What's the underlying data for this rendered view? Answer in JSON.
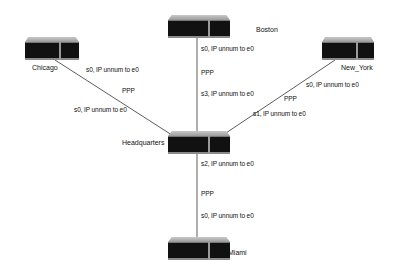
{
  "diagram": {
    "type": "network-topology",
    "nodes": [
      {
        "id": "chicago",
        "label": "Chicago"
      },
      {
        "id": "boston",
        "label": "Boston"
      },
      {
        "id": "new_york",
        "label": "New_York"
      },
      {
        "id": "headquarters",
        "label": "Headquarters"
      },
      {
        "id": "miami",
        "label": "Miami"
      }
    ],
    "links": [
      {
        "from": "chicago",
        "to": "headquarters",
        "protocol": "PPP",
        "near_label": "s0, IP unnum to e0",
        "far_label": "s0, IP unnum to e0"
      },
      {
        "from": "boston",
        "to": "headquarters",
        "protocol": "PPP",
        "near_label": "s0, IP unnum to e0",
        "far_label": "s3, IP unnum to e0"
      },
      {
        "from": "new_york",
        "to": "headquarters",
        "protocol": "PPP",
        "near_label": "s0, IP unnum to e0",
        "far_label": "s1, IP unnum to e0"
      },
      {
        "from": "headquarters",
        "to": "miami",
        "protocol": "PPP",
        "near_label": "s2, IP unnum to e0",
        "far_label": "s0, IP unnum to e0"
      }
    ]
  }
}
